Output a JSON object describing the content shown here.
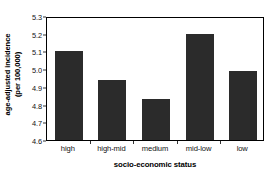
{
  "chart_data": {
    "type": "bar",
    "title": "",
    "subtitle": "",
    "xlabel": "socio-economic status",
    "ylabel": "age-adjusted incidence (per 100,000)",
    "ylabel_lines": [
      "age-adjusted incidence",
      "(per 100,000)"
    ],
    "categories": [
      "high",
      "high-mid",
      "medium",
      "mid-low",
      "low"
    ],
    "values": [
      5.1,
      4.94,
      4.83,
      5.2,
      4.99
    ],
    "ylim": [
      4.6,
      5.3
    ],
    "ytick_labels": [
      "5.3",
      "5.2",
      "5.1",
      "5.0",
      "4.9",
      "4.8",
      "4.7",
      "4.6"
    ],
    "ytick_values": [
      5.3,
      5.2,
      5.1,
      5.0,
      4.9,
      4.8,
      4.7,
      4.6
    ],
    "ytick_step": 0.1,
    "grid": false,
    "legend": false,
    "legend_position": "none",
    "bar_color": "#2b2b2b",
    "frame_color": "#000000",
    "background_color": "#ffffff",
    "text_color": "#111111"
  }
}
